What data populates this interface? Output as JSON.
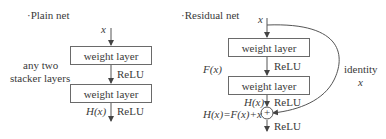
{
  "plain": {
    "title": "·Plain net",
    "input": "x",
    "side_label_line1": "any two",
    "side_label_line2": "stacker layers",
    "layer1": "weight layer",
    "act1": "ReLU",
    "layer2": "weight layer",
    "output": "H(x)",
    "act2": "ReLU"
  },
  "residual": {
    "title": "·Residual net",
    "input": "x",
    "fx_label": "F(x)",
    "layer1": "weight layer",
    "act1": "ReLU",
    "layer2": "weight layer",
    "hx_label": "H(x)",
    "act2": "ReLU",
    "sum_label": "H(x)=F(x)+x",
    "sum_symbol": "+",
    "act3": "ReLU",
    "identity_label": "identity",
    "identity_var": "x"
  },
  "colors": {
    "stroke": "#5a5a5a",
    "text": "#3a3a3a"
  }
}
